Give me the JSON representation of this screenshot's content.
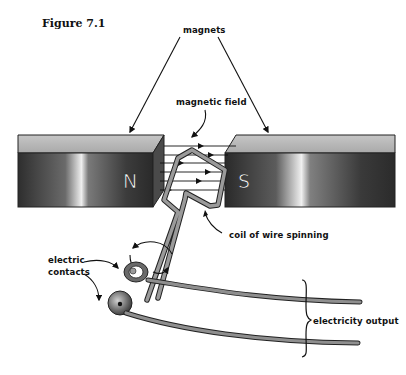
{
  "figure": {
    "title": "Figure 7.1"
  },
  "labels": {
    "magnets": "magnets",
    "magnetic_field": "magnetic field",
    "coil": "coil of wire spinning",
    "contacts_line1": "electric",
    "contacts_line2": "contacts",
    "output": "electricity output"
  },
  "poles": {
    "north": "N",
    "south": "S"
  },
  "colors": {
    "magnet_top": "#b9b9b9",
    "magnet_face_dark": "#3a3a3a",
    "magnet_face_highlight": "#f4f4f4",
    "wire": "#8f8f8f",
    "line": "#111111"
  }
}
